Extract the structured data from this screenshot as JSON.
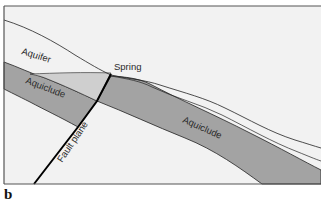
{
  "figure": {
    "panel_label": "b",
    "labels": {
      "aquifer": "Aquifer",
      "spring": "Spring",
      "aquiclude_left": "Aquiclude",
      "aquiclude_right": "Aquiclude",
      "fault_plane": "Fault plane"
    },
    "colors": {
      "background": "#f2f2f2",
      "aquiclude": "#a3a3a3",
      "aquifer_wedge": "#cfcfcf",
      "lines": "#222222",
      "fault": "#000000",
      "frame": "#555555"
    }
  }
}
